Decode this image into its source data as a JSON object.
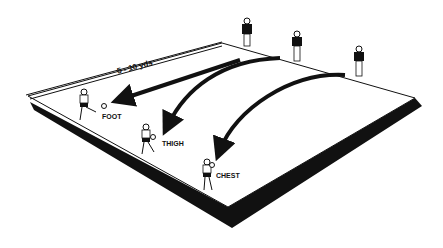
{
  "diagram": {
    "dimension_label": "5 - 10 yds",
    "labels": {
      "foot": "FOOT",
      "thigh": "THIGH",
      "chest": "CHEST"
    },
    "colors": {
      "ink": "#111111",
      "field": "#ffffff",
      "background": "#ffffff"
    },
    "servers_count": 3,
    "receivers": [
      "FOOT",
      "THIGH",
      "CHEST"
    ]
  }
}
